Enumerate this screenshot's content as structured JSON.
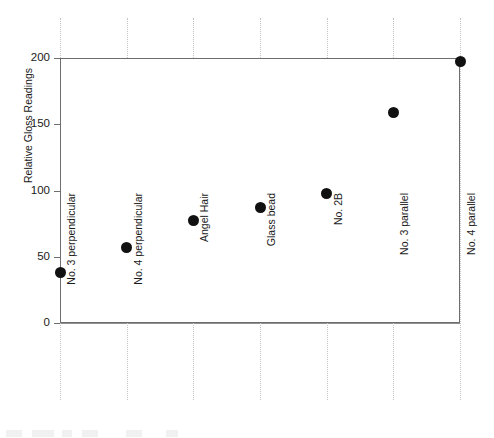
{
  "chart_data": {
    "type": "scatter",
    "title": "",
    "xlabel": "",
    "ylabel": "Relative Gloss Readings",
    "categories": [
      "No. 3 perpendicular",
      "No. 4 perpendicular",
      "Angel Hair",
      "Glass bead",
      "No. 2B",
      "No. 3 parallel",
      "No. 4 parallel"
    ],
    "values": [
      38,
      57,
      77,
      87,
      98,
      159,
      197
    ],
    "ylim": [
      0,
      200
    ],
    "yticks": [
      0,
      50,
      100,
      150,
      200
    ],
    "ytick_labels": [
      "0",
      "50",
      "100",
      "150",
      "200"
    ],
    "grid": {
      "horizontal": true,
      "vertical": true,
      "horizontal_style": "solid",
      "vertical_style": "dotted"
    },
    "legend": null,
    "marker": {
      "shape": "circle",
      "filled": true,
      "color": "#111111"
    },
    "colors": {
      "marker": "#111111",
      "axis": "#6e6e6e",
      "horizontal_grid": "#8f8f8f",
      "vertical_grid": "#c2c2c2",
      "text": "#1a1a1a",
      "background": "#ffffff"
    }
  }
}
